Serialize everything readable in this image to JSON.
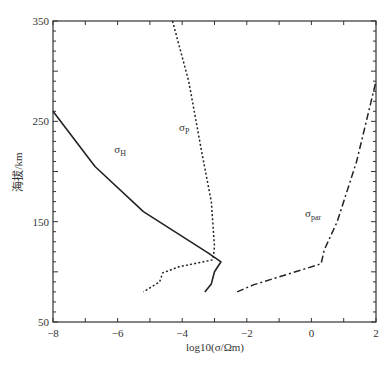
{
  "chart_data": {
    "type": "line",
    "title": "",
    "xlabel": "log10(σ/Ωm)",
    "ylabel": "海拔/km",
    "xlim": [
      -8,
      2
    ],
    "ylim": [
      50,
      350
    ],
    "x_ticks": [
      -8,
      -6,
      -4,
      -2,
      0,
      2
    ],
    "x_tick_labels": [
      "−8",
      "−6",
      "−4",
      "−2",
      "0",
      "2"
    ],
    "y_ticks": [
      50,
      150,
      250,
      350
    ],
    "y_tick_labels": [
      "50",
      "150",
      "250",
      "350"
    ],
    "grid": false,
    "legend": "inline labels",
    "series": [
      {
        "name": "σH",
        "label_main": "σ",
        "label_sub": "H",
        "style": "solid",
        "points": [
          [
            -8,
            260
          ],
          [
            -6.7,
            205
          ],
          [
            -5.2,
            160
          ],
          [
            -3.2,
            119
          ],
          [
            -2.8,
            110
          ],
          [
            -3.0,
            100
          ],
          [
            -3.1,
            88
          ],
          [
            -3.3,
            80
          ]
        ]
      },
      {
        "name": "σP",
        "label_main": "σ",
        "label_sub": "P",
        "style": "dotted",
        "points": [
          [
            -4.3,
            350
          ],
          [
            -3.8,
            290
          ],
          [
            -3.4,
            220
          ],
          [
            -3.1,
            170
          ],
          [
            -3.0,
            125
          ],
          [
            -3.05,
            112
          ],
          [
            -4.1,
            105
          ],
          [
            -4.6,
            99
          ],
          [
            -4.7,
            90
          ],
          [
            -5.2,
            80
          ]
        ]
      },
      {
        "name": "σpar",
        "label_main": "σ",
        "label_sub": "par",
        "style": "dashdot",
        "points": [
          [
            -2.3,
            80
          ],
          [
            -1.8,
            87
          ],
          [
            0.3,
            108
          ],
          [
            0.4,
            122
          ],
          [
            0.8,
            150
          ],
          [
            1.4,
            210
          ],
          [
            2.0,
            290
          ]
        ]
      }
    ],
    "labels": [
      {
        "series": "σH",
        "x": -6.1,
        "y": 218
      },
      {
        "series": "σP",
        "x": -4.1,
        "y": 240
      },
      {
        "series": "σpar",
        "x": -0.2,
        "y": 155
      }
    ]
  }
}
